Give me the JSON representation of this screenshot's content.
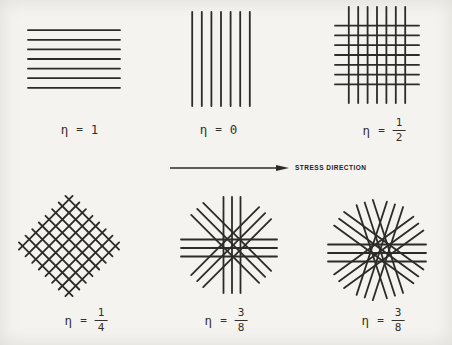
{
  "figure": {
    "background_color": "#f4f3ef",
    "line_color": "#2d2b27",
    "stress_arrow": {
      "label": "STRESS DIRECTION",
      "x1": 170,
      "x2": 277,
      "tip_x": 289,
      "y": 168
    },
    "panels": [
      {
        "name": "unidirectional-parallel",
        "label": {
          "symbol": "η",
          "eq": "=",
          "value": "1"
        },
        "cx": 74,
        "cy": 59,
        "directions": [
          {
            "angle": 0,
            "count": 7,
            "spacing": 9.6,
            "length": 92,
            "phase": 0
          }
        ]
      },
      {
        "name": "unidirectional-perpendicular",
        "label": {
          "symbol": "η",
          "eq": "=",
          "value": "0"
        },
        "cx": 221,
        "cy": 59,
        "directions": [
          {
            "angle": 90,
            "count": 7,
            "spacing": 9.6,
            "length": 94,
            "phase": 0
          }
        ]
      },
      {
        "name": "cross-ply-0-90",
        "label": {
          "symbol": "η",
          "eq": "=",
          "numerator": "1",
          "denominator": "2"
        },
        "cx": 377,
        "cy": 55,
        "directions": [
          {
            "angle": 0,
            "count": 7,
            "spacing": 9.8,
            "length": 84,
            "phase": 0
          },
          {
            "angle": 90,
            "count": 7,
            "spacing": 9.4,
            "length": 96,
            "phase": 0
          }
        ]
      },
      {
        "name": "cross-ply-plus-minus-45",
        "label": {
          "symbol": "η",
          "eq": "=",
          "numerator": "1",
          "denominator": "4"
        },
        "cx": 69,
        "cy": 246,
        "directions": [
          {
            "angle": 45,
            "count": 8,
            "spacing": 9.4,
            "length": 76,
            "phase": 0
          },
          {
            "angle": 135,
            "count": 8,
            "spacing": 9.4,
            "length": 76,
            "phase": 0
          }
        ]
      },
      {
        "name": "star-four-directions",
        "label": {
          "symbol": "η",
          "eq": "=",
          "numerator": "3",
          "denominator": "8"
        },
        "cx": 229,
        "cy": 245,
        "directions": [
          {
            "angle": 0,
            "count": 3,
            "spacing": 8.5,
            "length": 96,
            "phase": 3
          },
          {
            "angle": 45,
            "count": 3,
            "spacing": 8.5,
            "length": 96,
            "phase": 3
          },
          {
            "angle": 90,
            "count": 3,
            "spacing": 8.5,
            "length": 96,
            "phase": 3
          },
          {
            "angle": 135,
            "count": 3,
            "spacing": 8.5,
            "length": 96,
            "phase": 3
          }
        ]
      },
      {
        "name": "star-five-directions",
        "label": {
          "symbol": "η",
          "eq": "=",
          "numerator": "3",
          "denominator": "8"
        },
        "cx": 377,
        "cy": 250,
        "directions": [
          {
            "angle": 0,
            "count": 3,
            "spacing": 8.5,
            "length": 98,
            "phase": 3
          },
          {
            "angle": 36,
            "count": 3,
            "spacing": 8.5,
            "length": 98,
            "phase": 3
          },
          {
            "angle": 72,
            "count": 3,
            "spacing": 8.5,
            "length": 98,
            "phase": 3
          },
          {
            "angle": 108,
            "count": 3,
            "spacing": 8.5,
            "length": 98,
            "phase": 3
          },
          {
            "angle": 144,
            "count": 3,
            "spacing": 8.5,
            "length": 98,
            "phase": 3
          }
        ]
      }
    ]
  }
}
